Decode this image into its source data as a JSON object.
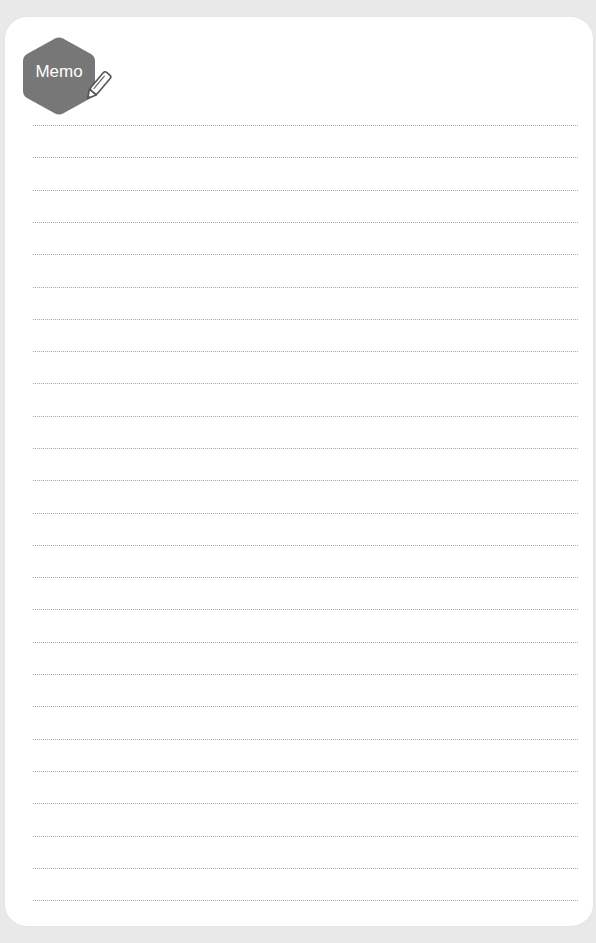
{
  "memo": {
    "title": "Memo",
    "badge_color": "#777777",
    "badge_icon": "pencil-icon",
    "line_color": "#a9a9a9",
    "line_count": 25,
    "line_spacing_px": 32.3,
    "lines": []
  }
}
